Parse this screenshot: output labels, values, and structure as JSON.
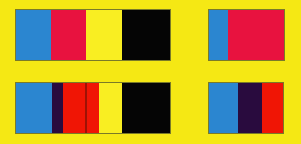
{
  "image": {
    "title": "Color band strips on yellow background",
    "width": 301,
    "height": 144,
    "background_color": "#f5e814",
    "layout": "2 rows x 2 columns of horizontal color-band panels"
  },
  "palette": {
    "yellow_background": "#f5e814",
    "azure_blue": "#2b86d0",
    "crimson": "#e8123f",
    "pure_yellow": "#f9ee22",
    "black": "#050505",
    "dark_purple": "#290b3e",
    "bright_red": "#f01505",
    "dark_red_divider": "#9e1206",
    "edge_outline": "#7a7a28"
  },
  "panels": [
    {
      "id": "top-left-strip",
      "row": "top",
      "column": "left",
      "x": 16,
      "y": 10,
      "width": 154,
      "height": 50,
      "band_count": 4,
      "bands": [
        {
          "name": "blue-band",
          "color": "#2b86d0",
          "width": 35
        },
        {
          "name": "crimson-band",
          "color": "#e8123f",
          "width": 35
        },
        {
          "name": "yellow-band",
          "color": "#f9ee22",
          "width": 36
        },
        {
          "name": "black-band",
          "color": "#050505",
          "width": 48
        }
      ]
    },
    {
      "id": "top-right-strip",
      "row": "top",
      "column": "right",
      "x": 209,
      "y": 10,
      "width": 75,
      "height": 50,
      "band_count": 2,
      "bands": [
        {
          "name": "blue-band",
          "color": "#2b86d0",
          "width": 19
        },
        {
          "name": "crimson-band",
          "color": "#e8123f",
          "width": 56
        }
      ]
    },
    {
      "id": "bottom-left-strip",
      "row": "bottom",
      "column": "left",
      "x": 16,
      "y": 83,
      "width": 154,
      "height": 50,
      "band_count": 6,
      "bands": [
        {
          "name": "blue-band",
          "color": "#2b86d0",
          "width": 36
        },
        {
          "name": "dark-purple-band",
          "color": "#290b3e",
          "width": 11
        },
        {
          "name": "red-band-left",
          "color": "#f01505",
          "width": 22
        },
        {
          "name": "dark-red-divider",
          "color": "#9e1206",
          "width": 2
        },
        {
          "name": "red-band-right",
          "color": "#f01505",
          "width": 12
        },
        {
          "name": "yellow-band",
          "color": "#f9ee22",
          "width": 23
        },
        {
          "name": "black-band",
          "color": "#050505",
          "width": 48
        }
      ]
    },
    {
      "id": "bottom-right-strip",
      "row": "bottom",
      "column": "right",
      "x": 209,
      "y": 83,
      "width": 74,
      "height": 50,
      "band_count": 3,
      "bands": [
        {
          "name": "blue-band",
          "color": "#2b86d0",
          "width": 29
        },
        {
          "name": "dark-purple-band",
          "color": "#290b3e",
          "width": 24
        },
        {
          "name": "red-band",
          "color": "#f01505",
          "width": 21
        }
      ]
    }
  ]
}
